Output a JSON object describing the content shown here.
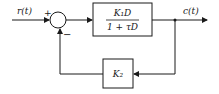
{
  "diagram": {
    "type": "control-block-diagram",
    "input": {
      "label": "r(t)"
    },
    "output": {
      "label": "c(t)"
    },
    "summing_junction": {
      "plus_sign": "+",
      "minus_sign": "−"
    },
    "forward_block": {
      "numerator": "K₁D",
      "denominator": "1 + τD"
    },
    "feedback_block": {
      "label": "K₂"
    },
    "colors": {
      "stroke": "#1a1a1a",
      "background": "#ffffff"
    }
  }
}
